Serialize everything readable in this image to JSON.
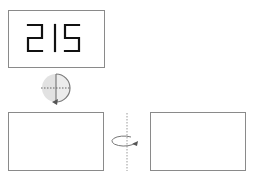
{
  "display": {
    "digits": "215",
    "segment_color": "#111111"
  },
  "icons": {
    "flip_vertical_axis": "rotate-around-vertical-axis-icon",
    "rotate_half_circle": "half-circle-rotation-icon"
  },
  "colors": {
    "box_border": "#8a8a8a",
    "circle_fill": "#e2e2e2",
    "guide_line": "#9a9a9a",
    "arrow": "#666666"
  },
  "panels": [
    {
      "name": "top-display-panel"
    },
    {
      "name": "bottom-left-panel"
    },
    {
      "name": "bottom-right-panel"
    }
  ]
}
